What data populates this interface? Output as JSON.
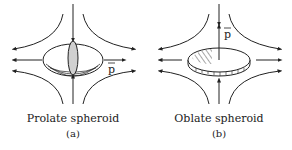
{
  "panels": [
    {
      "id": "a",
      "title": "Prolate spheroid",
      "label": "(a)",
      "vector_label": "p"
    },
    {
      "id": "b",
      "title": "Oblate spheroid",
      "label": "(b)",
      "vector_label": "p"
    }
  ],
  "colors": {
    "stroke": "#222222",
    "fill_shape": "#d0d0d0"
  }
}
